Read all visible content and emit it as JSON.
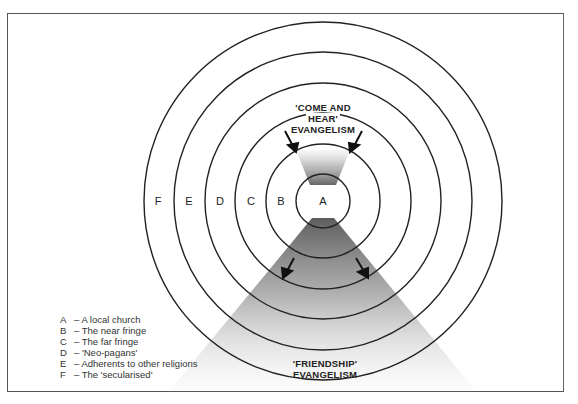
{
  "diagram": {
    "center": {
      "x": 323,
      "y": 201
    },
    "rings": [
      {
        "key": "A",
        "radius": 27,
        "label_x": 323
      },
      {
        "key": "B",
        "radius": 57,
        "label_x": 281
      },
      {
        "key": "C",
        "radius": 88,
        "label_x": 251
      },
      {
        "key": "D",
        "radius": 118,
        "label_x": 220
      },
      {
        "key": "E",
        "radius": 149,
        "label_x": 189
      },
      {
        "key": "F",
        "radius": 179,
        "label_x": 158
      }
    ],
    "top_heading": {
      "line1": "'COME AND",
      "line2": "HEAR'",
      "line3": "EVANGELISM"
    },
    "bottom_heading": {
      "line1": "'FRIENDSHIP'",
      "line2": "EVANGELISM"
    },
    "colors": {
      "stroke": "#222222",
      "shade": "#6a6a6a"
    }
  },
  "legend": [
    {
      "key": "A",
      "text": "– A local church"
    },
    {
      "key": "B",
      "text": "– The near fringe"
    },
    {
      "key": "C",
      "text": "– The far fringe"
    },
    {
      "key": "D",
      "text": "– 'Neo-pagans'"
    },
    {
      "key": "E",
      "text": "– Adherents to other religions"
    },
    {
      "key": "F",
      "text": "– The 'secularised'"
    }
  ]
}
